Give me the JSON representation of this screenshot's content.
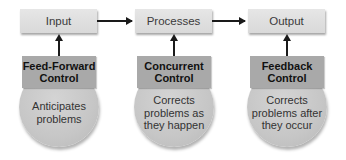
{
  "flow": {
    "boxes": [
      {
        "label": "Input"
      },
      {
        "label": "Processes"
      },
      {
        "label": "Output"
      }
    ]
  },
  "controls": [
    {
      "title_line1": "Feed-Forward",
      "title_line2": "Control",
      "desc_line1": "Anticipates",
      "desc_line2": "problems",
      "desc_line3": ""
    },
    {
      "title_line1": "Concurrent",
      "title_line2": "Control",
      "desc_line1": "Corrects",
      "desc_line2": "problems as",
      "desc_line3": "they happen"
    },
    {
      "title_line1": "Feedback",
      "title_line2": "Control",
      "desc_line1": "Corrects",
      "desc_line2": "problems after",
      "desc_line3": "they occur"
    }
  ],
  "colors": {
    "box_fill": "#dedede",
    "header_fill": "#a9a9a9",
    "circle_fill": "#c8c8c8",
    "arrow": "#1a1a1a"
  }
}
